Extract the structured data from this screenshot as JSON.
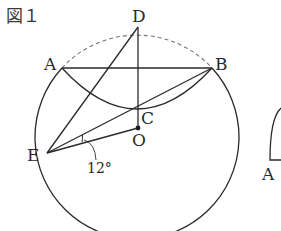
{
  "figure": {
    "title": "図１",
    "angle_label": "12°",
    "points": {
      "A": "A",
      "B": "B",
      "C": "C",
      "D": "D",
      "E": "E",
      "O": "O"
    },
    "second_figure_point": "A"
  },
  "colors": {
    "stroke": "#2a2a2a",
    "dashed": "#6a6a6a",
    "background": "#ffffff"
  }
}
